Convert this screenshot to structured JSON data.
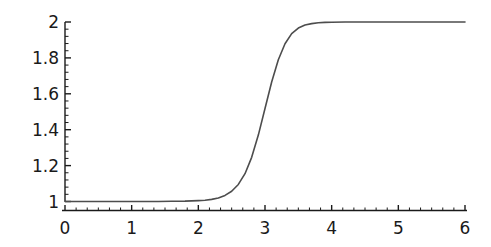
{
  "chart_data": {
    "type": "line",
    "title": "",
    "subtitle": "",
    "xlabel": "",
    "ylabel": "",
    "xlim": [
      0,
      6
    ],
    "ylim": [
      1,
      2
    ],
    "grid": false,
    "legend": null,
    "legend_position": "none",
    "x_ticks": [
      "0",
      "1",
      "2",
      "3",
      "4",
      "5",
      "6"
    ],
    "x_tick_values": [
      0,
      1,
      2,
      3,
      4,
      5,
      6
    ],
    "x_minor_ticks_per_interval": 5,
    "y_ticks": [
      "1",
      "1.2",
      "1.4",
      "1.6",
      "1.8",
      "2"
    ],
    "y_tick_values": [
      1,
      1.2,
      1.4,
      1.6,
      1.8,
      2
    ],
    "y_minor_ticks_per_interval": 4,
    "line_color": "#4d4d4d",
    "axis_color": "#1a1a1a",
    "background_color": "#ffffff",
    "series": [
      {
        "name": "curve",
        "description": "logistic / sigmoid step from 1 to 2, midpoint near x = 2.85",
        "x": [
          0.0,
          0.2,
          0.4,
          0.6,
          0.8,
          1.0,
          1.2,
          1.4,
          1.6,
          1.8,
          2.0,
          2.1,
          2.2,
          2.3,
          2.4,
          2.5,
          2.6,
          2.7,
          2.8,
          2.9,
          3.0,
          3.1,
          3.2,
          3.3,
          3.4,
          3.5,
          3.6,
          3.7,
          3.8,
          3.9,
          4.0,
          4.2,
          4.4,
          4.6,
          4.8,
          5.0,
          5.2,
          5.4,
          5.6,
          5.8,
          6.0
        ],
        "y": [
          1.0,
          1.0,
          1.0,
          1.0,
          1.0,
          1.0,
          1.0,
          1.0,
          1.001,
          1.002,
          1.005,
          1.007,
          1.012,
          1.02,
          1.034,
          1.057,
          1.095,
          1.155,
          1.246,
          1.37,
          1.518,
          1.666,
          1.79,
          1.879,
          1.935,
          1.966,
          1.983,
          1.991,
          1.996,
          1.998,
          1.999,
          2.0,
          2.0,
          2.0,
          2.0,
          2.0,
          2.0,
          2.0,
          2.0,
          2.0,
          2.0
        ]
      }
    ]
  },
  "axes": {
    "y_axis_name": "y-axis",
    "x_axis_name": "x-axis"
  }
}
